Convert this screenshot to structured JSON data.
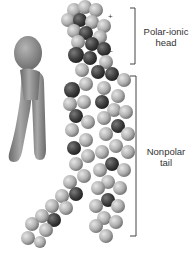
{
  "diagram": {
    "labels": {
      "head": "Polar-ionic head",
      "head_line1": "Polar-ionic",
      "head_line2": "head",
      "tail": "Nonpolar tail",
      "tail_line1": "Nonpolar",
      "tail_line2": "tail"
    },
    "charges": {
      "positive": "+",
      "negative": "–"
    },
    "colors": {
      "atom_light": "#b8b8b8",
      "atom_mid": "#8e8e8e",
      "atom_dark": "#3e3e3e",
      "icon_fill": "#8a8a8a",
      "bracket": "#444444"
    }
  }
}
